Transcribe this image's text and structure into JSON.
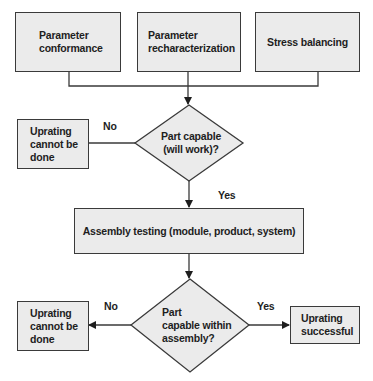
{
  "colors": {
    "fill": "#ebebeb",
    "stroke": "#3a3a3a",
    "text": "#1e1e1e"
  },
  "nodes": {
    "param_conformance": "Parameter conformance",
    "param_conformance_l1": "Parameter",
    "param_conformance_l2": "conformance",
    "param_rechar_l1": "Parameter",
    "param_rechar_l2": "recharacterization",
    "stress_balancing": "Stress balancing",
    "decision1_l1": "Part capable",
    "decision1_l2": "(will work)?",
    "fail1_l1": "Uprating",
    "fail1_l2": "cannot be",
    "fail1_l3": "done",
    "assembly_testing": "Assembly testing (module, product, system)",
    "decision2_l1": "Part",
    "decision2_l2": "capable within",
    "decision2_l3": "assembly?",
    "fail2_l1": "Uprating",
    "fail2_l2": "cannot be",
    "fail2_l3": "done",
    "success_l1": "Uprating",
    "success_l2": "successful"
  },
  "edge_labels": {
    "d1_no": "No",
    "d1_yes": "Yes",
    "d2_no": "No",
    "d2_yes": "Yes"
  }
}
